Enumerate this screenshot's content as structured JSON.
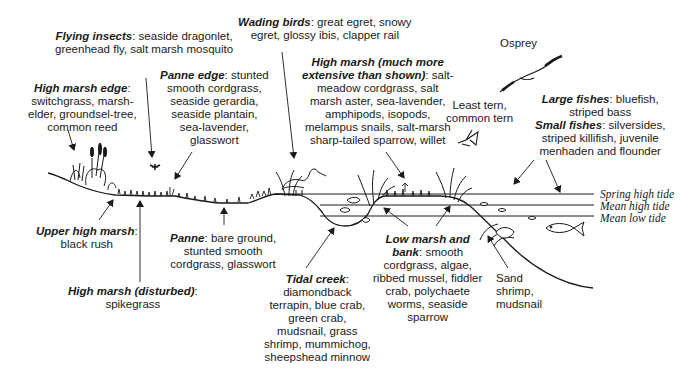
{
  "diagram": {
    "type": "salt-marsh cross-section",
    "labels": {
      "flying_insects": {
        "title": "Flying insects",
        "text": ": seaside dragonlet,",
        "line2": "greenhead fly, salt marsh mosquito"
      },
      "wading_birds": {
        "title": "Wading birds",
        "text": ": great egret, snowy",
        "line2": "egret, glossy ibis, clapper rail"
      },
      "osprey": {
        "text": "Osprey"
      },
      "high_marsh_edge": {
        "title": "High marsh edge",
        "text": ":",
        "lines": [
          "switchgrass, marsh-",
          "elder, groundsel-tree,",
          "common reed"
        ]
      },
      "panne_edge": {
        "title": "Panne edge",
        "text": ": stunted",
        "lines": [
          "smooth cordgrass,",
          "seaside gerardia,",
          "seaside plantain,",
          "sea-lavender,",
          "glasswort"
        ]
      },
      "high_marsh": {
        "title1": "High marsh (much more",
        "title2": "extensive than shown)",
        "text": ": salt-",
        "lines": [
          "meadow cordgrass, salt",
          "marsh aster, sea-lavender,",
          "amphipods, isopods,",
          "melampus snails, salt-marsh",
          "sharp-tailed sparrow, willet"
        ]
      },
      "terns": {
        "lines": [
          "Least tern,",
          "common tern"
        ]
      },
      "large_fishes": {
        "title": "Large fishes",
        "text": ": bluefish,",
        "line2": "striped bass"
      },
      "small_fishes": {
        "title": "Small fishes",
        "text": ": silversides,",
        "lines": [
          "striped killifish, juvenile",
          "menhaden and flounder"
        ]
      },
      "upper_high_marsh": {
        "title": "Upper high marsh",
        "text": ":",
        "line2": "black rush"
      },
      "high_marsh_disturbed": {
        "title": "High marsh (disturbed)",
        "text": ":",
        "line2": "spikegrass"
      },
      "panne": {
        "title": "Panne",
        "text": ": bare ground,",
        "lines": [
          "stunted smooth",
          "cordgrass, glasswort"
        ]
      },
      "tidal_creek": {
        "title": "Tidal creek",
        "text": ":",
        "lines": [
          "diamondback",
          "terrapin, blue crab,",
          "green crab,",
          "mudsnail, grass",
          "shrimp, mummichog,",
          "sheepshead minnow"
        ]
      },
      "low_marsh": {
        "title1": "Low marsh and",
        "title2": "bank",
        "text": ": smooth",
        "lines": [
          "cordgrass, algae,",
          "ribbed mussel, fiddler",
          "crab, polychaete",
          "worms, seaside",
          "sparrow"
        ]
      },
      "sand_shrimp": {
        "lines": [
          "Sand",
          "shrimp,",
          "mudsnail"
        ]
      }
    },
    "tide_levels": [
      {
        "name": "Spring high tide"
      },
      {
        "name": "Mean high tide"
      },
      {
        "name": "Mean low tide"
      }
    ],
    "colors": {
      "ink": "#1a1a1a",
      "background": "#ffffff"
    }
  }
}
